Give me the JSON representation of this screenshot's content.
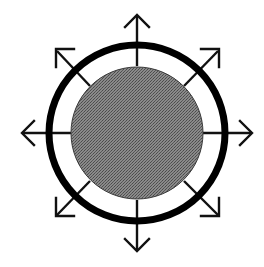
{
  "diagram": {
    "title": "Radial expansion symbol",
    "center": {
      "x": 137,
      "y": 133
    },
    "core": {
      "radius": 66,
      "fill": "#7b7b7b",
      "edge": "#3a3a3a"
    },
    "ring": {
      "radius": 88,
      "stroke_width": 7,
      "color": "#000000"
    },
    "arrow_color": "#111111",
    "arrows": [
      {
        "direction": "north"
      },
      {
        "direction": "north-east"
      },
      {
        "direction": "east"
      },
      {
        "direction": "south-east"
      },
      {
        "direction": "south"
      },
      {
        "direction": "south-west"
      },
      {
        "direction": "west"
      },
      {
        "direction": "north-west"
      }
    ]
  }
}
